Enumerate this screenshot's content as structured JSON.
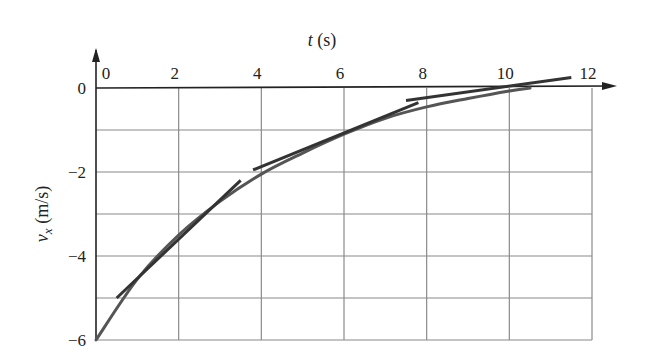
{
  "chart_data": {
    "type": "line",
    "title": "",
    "xlabel": "t (s)",
    "ylabel": "v_x (m/s)",
    "xlim": [
      0,
      12
    ],
    "ylim": [
      -6,
      0
    ],
    "grid": true,
    "legend": null,
    "x_ticks": [
      0,
      2,
      4,
      6,
      8,
      10,
      12
    ],
    "y_ticks": [
      0,
      -2,
      -4,
      -6
    ],
    "x_tick_labels": [
      "0",
      "2",
      "4",
      "6",
      "8",
      "10",
      "12"
    ],
    "y_tick_labels": [
      "0",
      "−2",
      "−4",
      "−6"
    ],
    "x_axis_position": "top",
    "series": [
      {
        "name": "v_x(t) curve",
        "x": [
          0,
          1,
          2,
          3,
          4,
          5,
          6,
          7,
          8,
          9,
          10,
          10.5
        ],
        "values": [
          -6.0,
          -4.55,
          -3.5,
          -2.7,
          -2.05,
          -1.55,
          -1.1,
          -0.72,
          -0.45,
          -0.25,
          -0.07,
          0.0
        ],
        "color": "#555555"
      }
    ],
    "tangent_lines": [
      {
        "name": "tangent at t=1.5",
        "x": [
          0.5,
          3.5
        ],
        "y": [
          -5.0,
          -2.2
        ]
      },
      {
        "name": "tangent at t=5",
        "x": [
          3.8,
          7.8
        ],
        "y": [
          -1.95,
          -0.35
        ]
      },
      {
        "name": "tangent at t=8.5",
        "x": [
          7.5,
          11.5
        ],
        "y": [
          -0.3,
          0.25
        ]
      }
    ]
  },
  "labels": {
    "x_title_italic": "t",
    "x_title_unit": " (s)",
    "y_title_italic": "v",
    "y_title_sub": "x",
    "y_title_unit": " (m/s)"
  }
}
